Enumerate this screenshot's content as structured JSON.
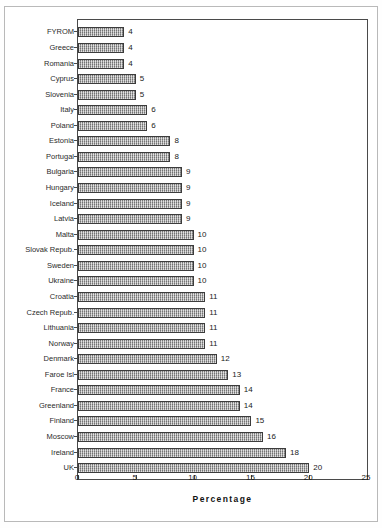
{
  "chart_data": {
    "type": "bar",
    "orientation": "horizontal",
    "title": "",
    "subtitle": "",
    "xlabel": "Percentage",
    "ylabel": "",
    "xlim": [
      0,
      25
    ],
    "xticks": [
      0,
      5,
      10,
      15,
      20,
      25
    ],
    "grid": false,
    "legend": null,
    "data_labels": true,
    "categories": [
      "FYROM",
      "Greece",
      "Romania",
      "Cyprus",
      "Slovenia",
      "Italy",
      "Poland",
      "Estonia",
      "Portugal",
      "Bulgaria",
      "Hungary",
      "Iceland",
      "Latvia",
      "Malta",
      "Slovak Repub.",
      "Sweden",
      "Ukraine",
      "Croatia",
      "Czech Repub.",
      "Lithuania",
      "Norway",
      "Denmark",
      "Faroe Isl",
      "France",
      "Greenland",
      "Finland",
      "Moscow",
      "Ireland",
      "UK"
    ],
    "values": [
      4,
      4,
      4,
      5,
      5,
      6,
      6,
      8,
      8,
      9,
      9,
      9,
      9,
      10,
      10,
      10,
      10,
      11,
      11,
      11,
      11,
      12,
      13,
      14,
      14,
      15,
      16,
      18,
      20
    ],
    "bar_color": "#a8a8a8",
    "bar_edge_color": "#3c3c3c"
  },
  "axis": {
    "x_title": "Percentage",
    "tick_labels": [
      "0",
      "5",
      "10",
      "15",
      "20",
      "25"
    ]
  }
}
